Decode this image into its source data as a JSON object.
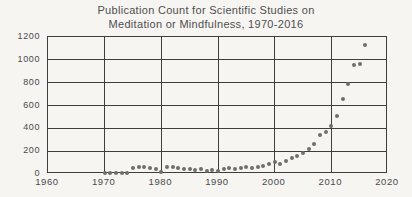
{
  "title": {
    "line1": "Publication Count for Scientific Studies on",
    "line2": "Meditation or Mindfulness, 1970-2016"
  },
  "chart_data": {
    "type": "scatter",
    "title": "Publication Count for Scientific Studies on Meditation or Mindfulness, 1970-2016",
    "xlabel": "",
    "ylabel": "",
    "xlim": [
      1960,
      2020
    ],
    "ylim": [
      0,
      1200
    ],
    "x_ticks": [
      1960,
      1970,
      1980,
      1990,
      2000,
      2010,
      2020
    ],
    "y_ticks": [
      0,
      200,
      400,
      600,
      800,
      1000,
      1200
    ],
    "grid": true,
    "legend": false,
    "x": [
      1970,
      1971,
      1972,
      1973,
      1974,
      1975,
      1976,
      1977,
      1978,
      1979,
      1980,
      1981,
      1982,
      1983,
      1984,
      1985,
      1986,
      1987,
      1988,
      1989,
      1990,
      1991,
      1992,
      1993,
      1994,
      1995,
      1996,
      1997,
      1998,
      1999,
      2000,
      2001,
      2002,
      2003,
      2004,
      2005,
      2006,
      2007,
      2008,
      2009,
      2010,
      2011,
      2012,
      2013,
      2014,
      2015,
      2016
    ],
    "y": [
      8,
      5,
      6,
      5,
      12,
      55,
      62,
      65,
      50,
      45,
      18,
      60,
      65,
      55,
      46,
      48,
      35,
      40,
      30,
      33,
      28,
      40,
      50,
      48,
      55,
      60,
      55,
      65,
      72,
      85,
      105,
      88,
      118,
      140,
      160,
      185,
      215,
      260,
      340,
      370,
      420,
      510,
      660,
      790,
      955,
      965,
      1130
    ],
    "colors": {
      "dot": "#6e6e6e",
      "grid": "#3e3e3e",
      "text": "#4a4a4a",
      "title_text": "#4f4f4f",
      "background": "#f6f5f2"
    }
  }
}
